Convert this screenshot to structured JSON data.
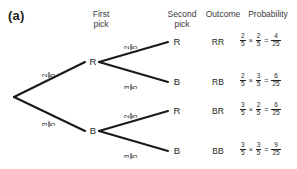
{
  "panel": {
    "label": "(a)"
  },
  "headers": {
    "first_pick": "First\npick",
    "second_pick": "Second\npick",
    "outcome": "Outcome",
    "probability": "Probability"
  },
  "first_pick_nodes": [
    {
      "label": "R"
    },
    {
      "label": "B"
    }
  ],
  "second_pick_nodes": [
    {
      "label": "R"
    },
    {
      "label": "B"
    },
    {
      "label": "R"
    },
    {
      "label": "B"
    }
  ],
  "outcomes": [
    "RR",
    "RB",
    "BR",
    "BB"
  ],
  "branch_labels": {
    "first_r": {
      "num": "2",
      "den": "5"
    },
    "first_b": {
      "num": "3",
      "den": "5"
    },
    "rr": {
      "num": "2",
      "den": "5"
    },
    "rb": {
      "num": "3",
      "den": "5"
    },
    "br": {
      "num": "2",
      "den": "5"
    },
    "bb": {
      "num": "3",
      "den": "5"
    }
  },
  "probabilities": [
    {
      "outcome": "RR",
      "p1": {
        "num": "2",
        "den": "5"
      },
      "times": "×",
      "p2": {
        "num": "2",
        "den": "5"
      },
      "equals": "=",
      "result": {
        "num": "4",
        "den": "25"
      }
    },
    {
      "outcome": "RB",
      "p1": {
        "num": "2",
        "den": "5"
      },
      "times": "×",
      "p2": {
        "num": "3",
        "den": "5"
      },
      "equals": "=",
      "result": {
        "num": "6",
        "den": "25"
      }
    },
    {
      "outcome": "BR",
      "p1": {
        "num": "3",
        "den": "5"
      },
      "times": "×",
      "p2": {
        "num": "2",
        "den": "5"
      },
      "equals": "=",
      "result": {
        "num": "6",
        "den": "25"
      }
    },
    {
      "outcome": "BB",
      "p1": {
        "num": "3",
        "den": "5"
      },
      "times": "×",
      "p2": {
        "num": "3",
        "den": "5"
      },
      "equals": "=",
      "result": {
        "num": "9",
        "den": "25"
      }
    }
  ],
  "colors": {
    "ink": "#231f20",
    "line": "#1a1a1a",
    "header_text": "#3a3a3a",
    "background": "#ffffff"
  }
}
